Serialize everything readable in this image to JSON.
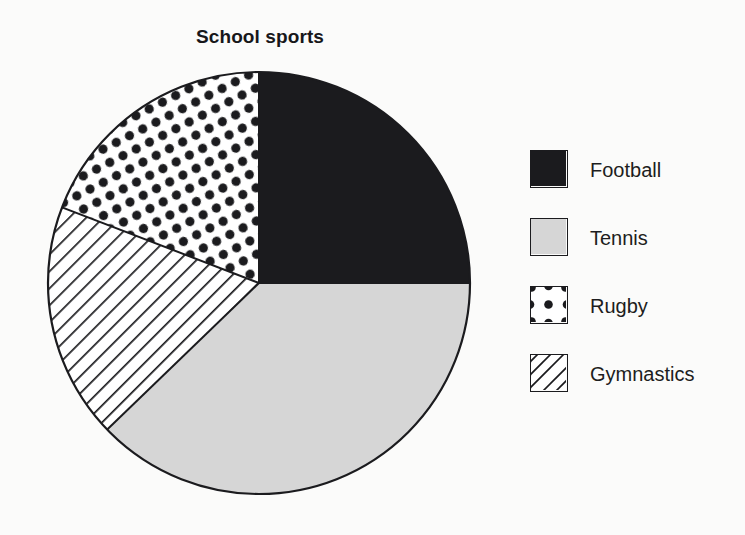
{
  "chart_data": {
    "type": "pie",
    "title": "School sports",
    "xlabel": "",
    "ylabel": "",
    "grid": false,
    "legend_position": "right",
    "start_angle_deg": 0,
    "direction": "clockwise",
    "center": {
      "x": 213,
      "y": 213
    },
    "radius": 211,
    "categories": [
      "Football",
      "Tennis",
      "Rugby",
      "Gymnastics"
    ],
    "values": [
      25,
      38,
      19,
      18
    ],
    "slices": [
      {
        "label": "Football",
        "value": 25,
        "percent": "25%",
        "start_deg": 0,
        "end_deg": 90,
        "fill": "#1b1b1e",
        "pattern": "solid",
        "swatch_icon": "solid-black-swatch-icon"
      },
      {
        "label": "Tennis",
        "value": 38,
        "percent": "38%",
        "start_deg": 90,
        "end_deg": 226,
        "fill": "#d6d6d6",
        "pattern": "solid",
        "swatch_icon": "light-gray-swatch-icon"
      },
      {
        "label": "Gymnastics",
        "value": 18,
        "percent": "18%",
        "start_deg": 226,
        "end_deg": 291,
        "fill": "#ffffff",
        "pattern": "diagonal-hatch",
        "swatch_icon": "diagonal-hatch-swatch-icon"
      },
      {
        "label": "Rugby",
        "value": 19,
        "percent": "19%",
        "start_deg": 291,
        "end_deg": 360,
        "fill": "#ffffff",
        "pattern": "polka-dots",
        "swatch_icon": "polka-dot-swatch-icon"
      }
    ]
  },
  "legend": {
    "items": [
      {
        "label": "Football",
        "pattern": "solid",
        "color": "#1b1b1e"
      },
      {
        "label": "Tennis",
        "pattern": "solid",
        "color": "#d6d6d6"
      },
      {
        "label": "Rugby",
        "pattern": "polka-dots",
        "color": "#1b1b1e"
      },
      {
        "label": "Gymnastics",
        "pattern": "diagonal-hatch",
        "color": "#1b1b1e"
      }
    ]
  },
  "colors": {
    "background": "#fbfbfa",
    "outline": "#1b1b1e",
    "football": "#1b1b1e",
    "tennis": "#d6d6d6",
    "pattern_ink": "#1b1b1e"
  }
}
